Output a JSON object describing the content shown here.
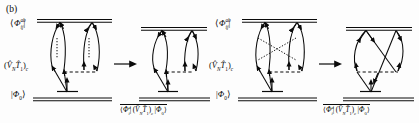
{
  "figure": {
    "panel_tag": "(b)",
    "transform_arrow": "→"
  },
  "colors": {
    "ink": "#0a0a0a",
    "background": "#fdfdfd",
    "line": "#1a1a1a"
  },
  "labels": {
    "bra_doubly_excited": "⟨Φ",
    "bra_doubly_excited_sub": "ij",
    "bra_doubly_excited_sup": "ab",
    "bra_close": "|",
    "operator": "(V̂",
    "operator_sub_n": "N",
    "operator_t": "T̂",
    "operator_sub_1": "1",
    "operator_close": ")",
    "operator_sub_c": "c",
    "ket_reference": "|Φ",
    "ket_reference_sub": "0",
    "ket_close": "⟩",
    "bra_single_sub": "i",
    "bra_single_sup": "a"
  },
  "levels": [
    {
      "name": "bra-level",
      "label_key": "bra_doubly_excited",
      "style": "double-line"
    },
    {
      "name": "interaction-level",
      "label_key": "operator",
      "style": "dashed-vertex"
    },
    {
      "name": "ket-level",
      "label_key": "ket_reference",
      "style": "double-line"
    }
  ],
  "panels": [
    {
      "name": "panel-1-uncrossed-dotted",
      "index": 1,
      "group": "left",
      "crossing": "none",
      "dotted_lines": "vertical-uncrossed",
      "result_label": "matrix-element"
    },
    {
      "name": "panel-2-resolved",
      "index": 2,
      "group": "left",
      "crossing": "none",
      "dotted_lines": "none",
      "result_label": "matrix-element"
    },
    {
      "name": "panel-3-crossed-dotted",
      "index": 3,
      "group": "right",
      "crossing": "dotted-x",
      "dotted_lines": "crossed",
      "result_label": "matrix-element"
    },
    {
      "name": "panel-4-crossed-solid",
      "index": 4,
      "group": "right",
      "crossing": "solid-x",
      "dotted_lines": "none",
      "result_label": "matrix-element"
    }
  ],
  "result_expression": {
    "bra": "⟨Φ",
    "bra_sub": "i",
    "bra_sup": "a",
    "mid_open": "|(V̂",
    "mid_n": "N",
    "mid_t": "T̂",
    "mid_1": "1",
    "mid_close": ")",
    "mid_c": "c",
    "ket": "|Φ",
    "ket_sub": "0",
    "ket_close": "⟩"
  }
}
